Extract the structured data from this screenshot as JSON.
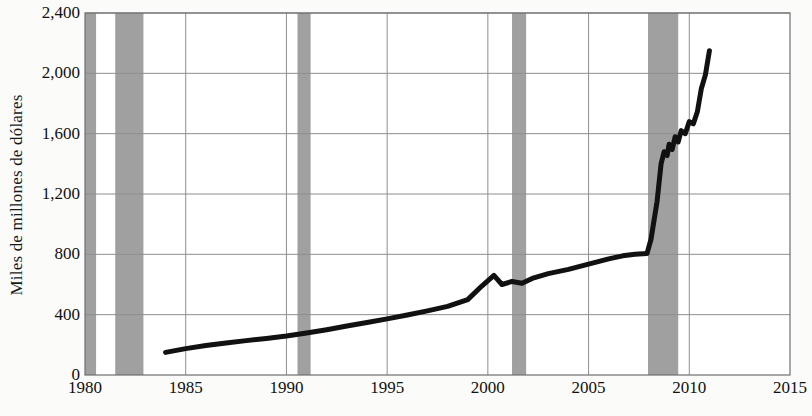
{
  "chart_data": {
    "type": "line",
    "title": "",
    "subtitle": "",
    "xlabel": "",
    "ylabel": "Miles de millones de dólares",
    "xlim": [
      1980,
      2015
    ],
    "ylim": [
      0,
      2400
    ],
    "xticks": [
      1980,
      1985,
      1990,
      1995,
      2000,
      2005,
      2010,
      2015
    ],
    "xtick_labels": [
      "1980",
      "1985",
      "1990",
      "1995",
      "2000",
      "2005",
      "2010",
      "2015"
    ],
    "yticks": [
      0,
      400,
      800,
      1200,
      1600,
      2000,
      2400
    ],
    "ytick_labels": [
      "0",
      "400",
      "800",
      "1,200",
      "1,600",
      "2,000",
      "2,400"
    ],
    "grid": true,
    "legend": null,
    "legend_position": "none",
    "line_color": "#111111",
    "line_width": 5,
    "recession_band_color": "#9b9b9b",
    "recession_bands": [
      {
        "start": 1980.0,
        "end": 1980.55
      },
      {
        "start": 1981.5,
        "end": 1982.9
      },
      {
        "start": 1990.55,
        "end": 1991.2
      },
      {
        "start": 2001.2,
        "end": 2001.9
      },
      {
        "start": 2007.95,
        "end": 2009.45
      }
    ],
    "series": [
      {
        "name": "",
        "x": [
          1984.0,
          1985.0,
          1986.0,
          1987.0,
          1988.0,
          1989.0,
          1990.0,
          1991.0,
          1992.0,
          1993.0,
          1994.0,
          1995.0,
          1996.0,
          1997.0,
          1998.0,
          1999.0,
          1999.7,
          2000.3,
          2000.7,
          2001.2,
          2001.7,
          2002.2,
          2003.0,
          2004.0,
          2005.0,
          2006.0,
          2006.7,
          2007.3,
          2007.9,
          2008.1,
          2008.4,
          2008.6,
          2008.75,
          2008.9,
          2009.0,
          2009.15,
          2009.3,
          2009.45,
          2009.6,
          2009.8,
          2010.0,
          2010.2,
          2010.4,
          2010.6,
          2010.8,
          2011.0
        ],
        "y": [
          150,
          175,
          195,
          212,
          228,
          242,
          258,
          278,
          300,
          325,
          348,
          372,
          398,
          425,
          455,
          500,
          590,
          660,
          600,
          620,
          608,
          640,
          672,
          700,
          735,
          770,
          790,
          800,
          805,
          900,
          1150,
          1400,
          1480,
          1455,
          1530,
          1495,
          1580,
          1545,
          1620,
          1600,
          1680,
          1665,
          1745,
          1900,
          1990,
          2150
        ]
      }
    ]
  },
  "axes": {
    "y_axis_title": "Miles de millones de dólares"
  }
}
